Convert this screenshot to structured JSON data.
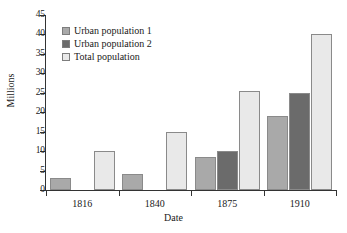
{
  "chart_data": {
    "type": "bar",
    "title": "",
    "xlabel": "Date",
    "ylabel": "Millions",
    "categories": [
      "1816",
      "1840",
      "1875",
      "1910"
    ],
    "ylim": [
      0,
      45
    ],
    "yticks": [
      0,
      5,
      10,
      15,
      20,
      25,
      30,
      35,
      40,
      45
    ],
    "ytick_labels": [
      "0",
      "5",
      "10",
      "15",
      "20",
      "25",
      "30",
      "35",
      "40",
      "45"
    ],
    "grid": false,
    "legend_position": "upper-left",
    "series": [
      {
        "name": "Urban population 1",
        "color": "#a9a9a9",
        "values": [
          3,
          4,
          8.5,
          19
        ]
      },
      {
        "name": "Urban population 2",
        "color": "#6b6b6b",
        "values": [
          null,
          null,
          10,
          25
        ]
      },
      {
        "name": "Total population",
        "color": "#e9e9e9",
        "values": [
          10,
          15,
          25.5,
          40
        ]
      }
    ]
  }
}
